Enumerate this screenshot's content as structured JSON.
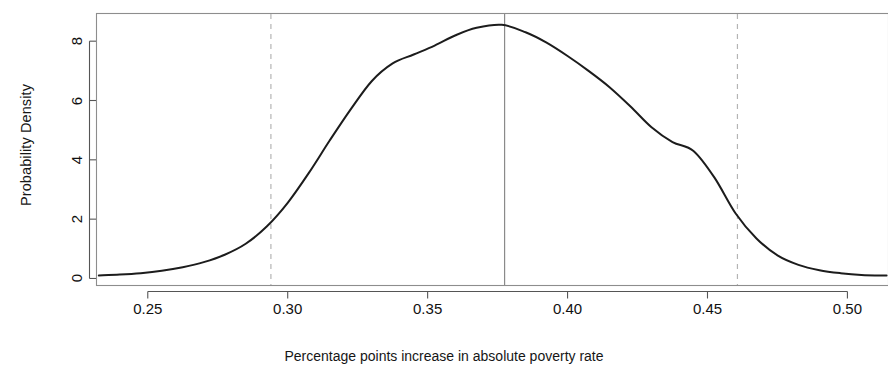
{
  "chart_data": {
    "type": "line",
    "title": "",
    "subtitle": "",
    "xlabel": "Percentage points increase in absolute poverty rate",
    "ylabel": "Probability Density",
    "xlim": [
      0.2315,
      0.5145
    ],
    "ylim": [
      -0.22,
      8.95
    ],
    "grid": false,
    "legend": null,
    "xticks": [
      "0.25",
      "0.30",
      "0.35",
      "0.40",
      "0.45",
      "0.50"
    ],
    "xtick_values": [
      0.25,
      0.3,
      0.35,
      0.4,
      0.45,
      0.5
    ],
    "yticks": [
      "0",
      "2",
      "4",
      "6",
      "8"
    ],
    "ytick_values": [
      0,
      2,
      4,
      6,
      8
    ],
    "annotations": [
      {
        "name": "point-estimate",
        "type": "vline",
        "style": "solid",
        "x": 0.3775,
        "label": ""
      },
      {
        "name": "lower-confidence-bound",
        "type": "vline",
        "style": "dashed",
        "x": 0.294,
        "label": ""
      },
      {
        "name": "upper-confidence-bound",
        "type": "vline",
        "style": "dashed",
        "x": 0.4607,
        "label": ""
      }
    ],
    "series": [
      {
        "name": "Probability density",
        "color": "#1c1c1c",
        "x": [
          0.2325,
          0.24,
          0.2475,
          0.255,
          0.2625,
          0.27,
          0.2775,
          0.285,
          0.2925,
          0.3,
          0.3075,
          0.315,
          0.3225,
          0.33,
          0.3375,
          0.345,
          0.3525,
          0.36,
          0.3675,
          0.3765,
          0.385,
          0.3925,
          0.4,
          0.4075,
          0.415,
          0.4225,
          0.43,
          0.4375,
          0.445,
          0.4525,
          0.46,
          0.4675,
          0.475,
          0.4825,
          0.49,
          0.4975,
          0.505,
          0.514
        ],
        "y": [
          0.1,
          0.13,
          0.18,
          0.26,
          0.38,
          0.55,
          0.8,
          1.17,
          1.75,
          2.55,
          3.55,
          4.65,
          5.7,
          6.65,
          7.25,
          7.55,
          7.85,
          8.2,
          8.45,
          8.55,
          8.3,
          7.95,
          7.5,
          7.0,
          6.45,
          5.8,
          5.1,
          4.6,
          4.3,
          3.4,
          2.2,
          1.35,
          0.78,
          0.46,
          0.28,
          0.18,
          0.12,
          0.1
        ]
      }
    ]
  },
  "axes": {
    "x_axis_name": "x-axis",
    "y_axis_name": "y-axis"
  }
}
